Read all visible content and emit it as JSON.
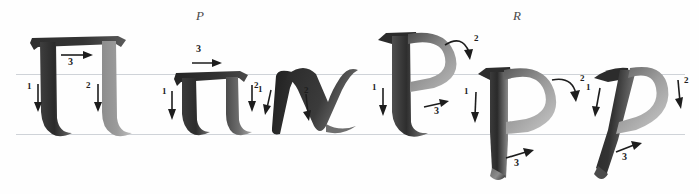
{
  "plate": {
    "title": "Greek calligraphy stroke-order exemplar: Pi and Rho",
    "background_color": "#fefefe",
    "ink_color": "#2b2b2b",
    "guide_color": "#cfd3d8"
  },
  "guides": [
    {
      "name": "x-height-line",
      "y": 74
    },
    {
      "name": "baseline",
      "y": 134
    }
  ],
  "sections": [
    {
      "key": "pi",
      "label": "P",
      "label_x": 196,
      "label_y": 10
    },
    {
      "key": "rho",
      "label": "R",
      "label_x": 513,
      "label_y": 10
    }
  ],
  "glyphs": [
    {
      "key": "pi-uppercase",
      "letter": "Π",
      "name": "uppercase-pi",
      "case": "uppercase",
      "style": "upright",
      "stroke_count": 3,
      "x": 22,
      "strokes": [
        {
          "number": "1",
          "direction": "down",
          "arrow": "straight-down"
        },
        {
          "number": "2",
          "direction": "down",
          "arrow": "straight-down"
        },
        {
          "number": "3",
          "direction": "rightward",
          "arrow": "straight-right"
        }
      ]
    },
    {
      "key": "pi-lowercase",
      "letter": "π",
      "name": "lowercase-pi",
      "case": "lowercase",
      "style": "upright",
      "stroke_count": 3,
      "x": 160,
      "strokes": [
        {
          "number": "1",
          "direction": "down",
          "arrow": "straight-down"
        },
        {
          "number": "2",
          "direction": "down",
          "arrow": "straight-down"
        },
        {
          "number": "3",
          "direction": "rightward",
          "arrow": "straight-right"
        }
      ]
    },
    {
      "key": "pi-cursive",
      "letter": "π",
      "name": "cursive-pi",
      "case": "lowercase",
      "style": "italic-cursive",
      "stroke_count": 2,
      "x": 268,
      "strokes": [
        {
          "number": "1",
          "direction": "down",
          "arrow": "straight-down"
        },
        {
          "number": "2",
          "direction": "down",
          "arrow": "straight-down"
        }
      ]
    },
    {
      "key": "rho-uppercase",
      "letter": "Ρ",
      "name": "uppercase-rho",
      "case": "uppercase",
      "style": "upright",
      "stroke_count": 3,
      "x": 372,
      "strokes": [
        {
          "number": "1",
          "direction": "down",
          "arrow": "straight-down"
        },
        {
          "number": "2",
          "direction": "curve-right",
          "arrow": "curved-down-right"
        },
        {
          "number": "3",
          "direction": "rightward",
          "arrow": "straight-right"
        }
      ]
    },
    {
      "key": "rho-lowercase",
      "letter": "ρ",
      "name": "lowercase-rho",
      "case": "lowercase",
      "style": "upright",
      "stroke_count": 3,
      "x": 470,
      "strokes": [
        {
          "number": "1",
          "direction": "down",
          "arrow": "straight-down"
        },
        {
          "number": "2",
          "direction": "curve-right",
          "arrow": "curved-down-right"
        },
        {
          "number": "3",
          "direction": "rightward",
          "arrow": "straight-right"
        }
      ]
    },
    {
      "key": "rho-italic",
      "letter": "ρ",
      "name": "italic-rho",
      "case": "lowercase",
      "style": "italic",
      "stroke_count": 3,
      "x": 592,
      "strokes": [
        {
          "number": "1",
          "direction": "down",
          "arrow": "straight-down"
        },
        {
          "number": "2",
          "direction": "down",
          "arrow": "straight-down"
        },
        {
          "number": "3",
          "direction": "rightward",
          "arrow": "straight-right"
        }
      ]
    }
  ],
  "numerals": {
    "pi_uppercase": {
      "s1": "1",
      "s2": "2",
      "s3": "3"
    },
    "pi_lowercase": {
      "s1": "1",
      "s2": "2",
      "s3": "3"
    },
    "pi_cursive": {
      "s1": "1",
      "s2": "2"
    },
    "rho_uppercase": {
      "s1": "1",
      "s2": "2",
      "s3": "3"
    },
    "rho_lowercase": {
      "s1": "1",
      "s2": "2",
      "s3": "3"
    },
    "rho_italic": {
      "s1": "1",
      "s2": "2",
      "s3": "3"
    }
  }
}
